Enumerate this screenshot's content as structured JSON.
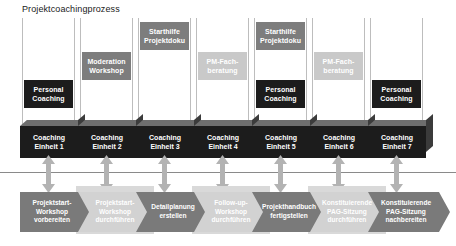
{
  "diagram": {
    "title": "Projektcoachingprozess",
    "type": "process-swimlane-timeline",
    "colors": {
      "dark_box": "#1c1c1c",
      "mid_box": "#7d7d7d",
      "light_box": "#c9c9c9",
      "chevron_dark": "#7a7a7a",
      "chevron_light": "#d2d2d2",
      "timeline_line": "#8a8a8a",
      "arrow": "#b3b3b3",
      "column_border": "#bdbdbd",
      "text_on_fill": "#ffffff",
      "title_text": "#1a1a1a"
    }
  },
  "columns": [
    {
      "index": 1,
      "unit_label_line1": "Coaching",
      "unit_label_line2": "Einheit 1",
      "roles": [
        {
          "name": "personal-coaching",
          "line1": "Personal",
          "line2": "Coaching",
          "tone": "dark"
        }
      ]
    },
    {
      "index": 2,
      "unit_label_line1": "Coaching",
      "unit_label_line2": "Einheit 2",
      "roles": [
        {
          "name": "moderation-workshop",
          "line1": "Moderation",
          "line2": "Workshop",
          "tone": "mid"
        }
      ]
    },
    {
      "index": 3,
      "unit_label_line1": "Coaching",
      "unit_label_line2": "Einheit 3",
      "roles": [
        {
          "name": "starthilfe-projektdoku",
          "line1": "Starthilfe",
          "line2": "Projektdoku",
          "tone": "mid"
        }
      ]
    },
    {
      "index": 4,
      "unit_label_line1": "Coaching",
      "unit_label_line2": "Einheit 4",
      "roles": [
        {
          "name": "pm-fachberatung",
          "line1": "PM-Fach-",
          "line2": "beratung",
          "tone": "light"
        }
      ]
    },
    {
      "index": 5,
      "unit_label_line1": "Coaching",
      "unit_label_line2": "Einheit 5",
      "roles": [
        {
          "name": "starthilfe-projektdoku",
          "line1": "Starthilfe",
          "line2": "Projektdoku",
          "tone": "mid"
        },
        {
          "name": "personal-coaching",
          "line1": "Personal",
          "line2": "Coaching",
          "tone": "dark"
        }
      ]
    },
    {
      "index": 6,
      "unit_label_line1": "Coaching",
      "unit_label_line2": "Einheit 6",
      "roles": [
        {
          "name": "pm-fachberatung",
          "line1": "PM-Fach-",
          "line2": "beratung",
          "tone": "light"
        }
      ]
    },
    {
      "index": 7,
      "unit_label_line1": "Coaching",
      "unit_label_line2": "Einheit 7",
      "roles": [
        {
          "name": "personal-coaching",
          "line1": "Personal",
          "line2": "Coaching",
          "tone": "dark"
        }
      ]
    }
  ],
  "process_steps": [
    {
      "index": 1,
      "tone": "dark",
      "line1": "Projektstart-",
      "line2": "Workshop",
      "line3": "vorbereiten"
    },
    {
      "index": 2,
      "tone": "light",
      "line1": "Projektstart-",
      "line2": "Workshop",
      "line3": "durchführen"
    },
    {
      "index": 3,
      "tone": "dark",
      "line1": "Detailplanung",
      "line2": "erstellen",
      "line3": ""
    },
    {
      "index": 4,
      "tone": "light",
      "line1": "Follow-up-",
      "line2": "Workshop",
      "line3": "durchführen"
    },
    {
      "index": 5,
      "tone": "dark",
      "line1": "Projekthandbuch",
      "line2": "fertigstellen",
      "line3": ""
    },
    {
      "index": 6,
      "tone": "light",
      "line1": "Konstituierende",
      "line2": "PAG-Sitzung",
      "line3": "durchführen"
    },
    {
      "index": 7,
      "tone": "dark",
      "line1": "Konstituierende",
      "line2": "PAG-Sitzung",
      "line3": "nachbereiten"
    }
  ]
}
